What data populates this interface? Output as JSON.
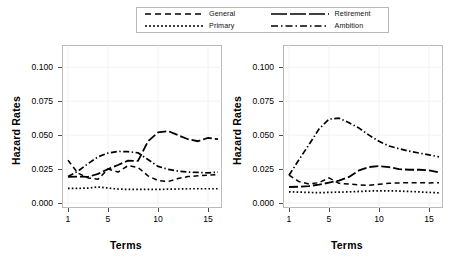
{
  "chart_data": [
    {
      "type": "line",
      "panel": "left",
      "title": "",
      "xlabel": "Terms",
      "ylabel": "Hazard Rates",
      "xlim": [
        1,
        16
      ],
      "ylim": [
        0.0,
        0.112
      ],
      "xticks": [
        1,
        5,
        10,
        15
      ],
      "yticks": [
        0.0,
        0.025,
        0.05,
        0.075,
        0.1
      ],
      "ytick_labels": [
        "0.000",
        "0.025",
        "0.050",
        "0.075",
        "0.100"
      ],
      "grid": true,
      "legend_position": "top-outside",
      "x": [
        1,
        2,
        3,
        4,
        5,
        6,
        7,
        8,
        9,
        10,
        11,
        12,
        13,
        14,
        15,
        16
      ],
      "series": [
        {
          "name": "General",
          "style": "dashed",
          "values": [
            0.0315,
            0.022,
            0.0185,
            0.0175,
            0.025,
            0.0228,
            0.0275,
            0.0262,
            0.02,
            0.0165,
            0.0158,
            0.018,
            0.0195,
            0.02,
            0.0205,
            0.021
          ]
        },
        {
          "name": "Primary",
          "style": "dotted",
          "values": [
            0.0108,
            0.0108,
            0.011,
            0.0118,
            0.011,
            0.0103,
            0.01,
            0.01,
            0.01,
            0.01,
            0.0102,
            0.0103,
            0.0105,
            0.0105,
            0.0105,
            0.0105
          ]
        },
        {
          "name": "Retirement",
          "style": "longdash",
          "values": [
            0.0192,
            0.0195,
            0.0192,
            0.0215,
            0.025,
            0.028,
            0.0312,
            0.031,
            0.0455,
            0.052,
            0.053,
            0.05,
            0.047,
            0.0455,
            0.048,
            0.047
          ]
        },
        {
          "name": "Ambition",
          "style": "dashdot",
          "values": [
            0.0195,
            0.0235,
            0.029,
            0.034,
            0.0368,
            0.038,
            0.0378,
            0.037,
            0.032,
            0.027,
            0.0248,
            0.0235,
            0.0228,
            0.0225,
            0.0222,
            0.0228
          ]
        }
      ]
    },
    {
      "type": "line",
      "panel": "right",
      "title": "",
      "xlabel": "Terms",
      "ylabel": "Hazard Rates",
      "xlim": [
        1,
        16
      ],
      "ylim": [
        0.0,
        0.112
      ],
      "xticks": [
        1,
        5,
        10,
        15
      ],
      "yticks": [
        0.0,
        0.025,
        0.05,
        0.075,
        0.1
      ],
      "ytick_labels": [
        "0.000",
        "0.025",
        "0.050",
        "0.075",
        "0.100"
      ],
      "grid": true,
      "legend_position": "top-outside",
      "x": [
        1,
        2,
        3,
        4,
        5,
        6,
        7,
        8,
        9,
        10,
        11,
        12,
        13,
        14,
        15,
        16
      ],
      "series": [
        {
          "name": "General",
          "style": "dashed",
          "values": [
            0.0205,
            0.0158,
            0.014,
            0.015,
            0.0185,
            0.0145,
            0.014,
            0.0133,
            0.013,
            0.0138,
            0.0145,
            0.0148,
            0.015,
            0.015,
            0.0148,
            0.015
          ]
        },
        {
          "name": "Primary",
          "style": "dotted",
          "values": [
            0.0082,
            0.008,
            0.0078,
            0.0076,
            0.0078,
            0.008,
            0.0082,
            0.0085,
            0.0088,
            0.009,
            0.009,
            0.0088,
            0.0085,
            0.0082,
            0.0078,
            0.0075
          ]
        },
        {
          "name": "Retirement",
          "style": "longdash",
          "values": [
            0.0118,
            0.012,
            0.0125,
            0.0135,
            0.015,
            0.0165,
            0.0192,
            0.024,
            0.0265,
            0.0272,
            0.0265,
            0.025,
            0.0245,
            0.0245,
            0.024,
            0.0225
          ]
        },
        {
          "name": "Ambition",
          "style": "dashdot",
          "values": [
            0.0205,
            0.032,
            0.043,
            0.0545,
            0.0618,
            0.0625,
            0.0592,
            0.0552,
            0.05,
            0.0455,
            0.042,
            0.04,
            0.0382,
            0.0368,
            0.0355,
            0.034
          ]
        }
      ]
    }
  ],
  "legend": {
    "entries": [
      {
        "label": "General",
        "style": "dashed"
      },
      {
        "label": "Retirement",
        "style": "longdash"
      },
      {
        "label": "Primary",
        "style": "dotted"
      },
      {
        "label": "Ambition",
        "style": "dashdot"
      }
    ]
  },
  "colors": {
    "line": "#000000",
    "frame": "#b9b9b9",
    "grid": "#f2f2f2",
    "text": "#000000",
    "background": "#ffffff"
  }
}
